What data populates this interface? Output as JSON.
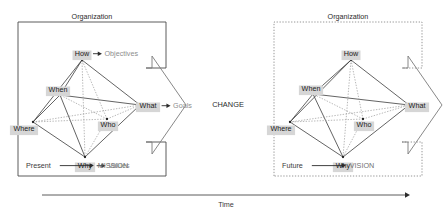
{
  "diagram": {
    "center_label": "CHANGE",
    "time_axis_label": "Time",
    "organization_label": "Organization",
    "node_chip_color": "#d6d6d6",
    "outcome_text_color": "#8d8d8d",
    "edge_color": "#3c3c3c",
    "inner_edge_color": "#9a9a9a"
  },
  "panels": [
    {
      "id": "present",
      "org_label": "Organization",
      "border_style": "solid",
      "footer_state": "Present",
      "footer_outcome": "MISSION",
      "nodes": [
        {
          "key": "how",
          "label": "How",
          "x": 82,
          "y": 60
        },
        {
          "key": "when",
          "label": "When",
          "x": 60,
          "y": 95
        },
        {
          "key": "where",
          "label": "Where",
          "x": 33,
          "y": 122
        },
        {
          "key": "who",
          "label": "Who",
          "x": 107,
          "y": 119
        },
        {
          "key": "what",
          "label": "What",
          "x": 140,
          "y": 105
        },
        {
          "key": "why",
          "label": "Why",
          "x": 85,
          "y": 157
        }
      ],
      "outcomes": [
        {
          "from": "how",
          "label": "Objectives"
        },
        {
          "from": "what",
          "label": "Goals"
        },
        {
          "from": "why",
          "label": "Values"
        }
      ]
    },
    {
      "id": "future",
      "org_label": "Organization",
      "border_style": "dotted",
      "footer_state": "Future",
      "footer_outcome": "VISION",
      "nodes": [
        {
          "key": "how",
          "label": "How",
          "x": 351,
          "y": 60
        },
        {
          "key": "when",
          "label": "When",
          "x": 313,
          "y": 94
        },
        {
          "key": "where",
          "label": "Where",
          "x": 290,
          "y": 122
        },
        {
          "key": "who",
          "label": "Who",
          "x": 363,
          "y": 119
        },
        {
          "key": "what",
          "label": "What",
          "x": 409,
          "y": 105
        },
        {
          "key": "why",
          "label": "Why",
          "x": 343,
          "y": 157
        }
      ],
      "outcomes": []
    }
  ]
}
